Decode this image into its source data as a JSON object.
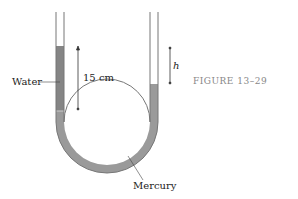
{
  "figure": {
    "caption": "FIGURE 13–29",
    "labels": {
      "water": "Water",
      "height": "15 cm",
      "h": "h",
      "mercury": "Mercury"
    },
    "colors": {
      "tube_wall": "#777777",
      "water": "#8a8a8a",
      "mercury": "#9a9a9a"
    }
  }
}
